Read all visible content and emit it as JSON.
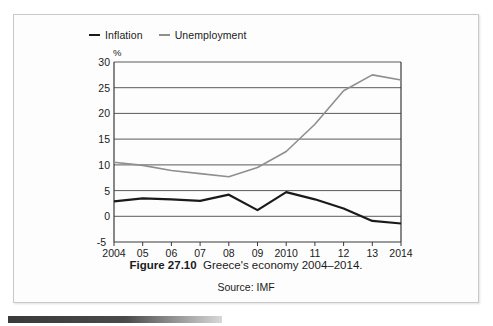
{
  "figure": {
    "caption_label": "Figure 27.10",
    "caption_text": "Greece's economy 2004–2014.",
    "source": "Source: IMF"
  },
  "colors": {
    "inflation": "#1a1a1a",
    "unemployment": "#8f8f8f",
    "grid": "#5a5a5a",
    "axis": "#4a4a4a",
    "frame": "#c9c9c9"
  },
  "chart_data": {
    "type": "line",
    "title": "Greece's economy 2004–2014.",
    "xlabel": "",
    "ylabel": "%",
    "ylim": [
      -5,
      30
    ],
    "yticks": [
      30,
      25,
      20,
      15,
      10,
      5,
      0,
      -5
    ],
    "grid": true,
    "legend_position": "top-left",
    "categories": [
      "2004",
      "05",
      "06",
      "07",
      "08",
      "09",
      "2010",
      "11",
      "12",
      "13",
      "2014"
    ],
    "x": [
      2004,
      2005,
      2006,
      2007,
      2008,
      2009,
      2010,
      2011,
      2012,
      2013,
      2014
    ],
    "series": [
      {
        "name": "Inflation",
        "color": "#1a1a1a",
        "values": [
          2.9,
          3.5,
          3.3,
          3.0,
          4.2,
          1.2,
          4.7,
          3.3,
          1.5,
          -0.9,
          -1.4
        ]
      },
      {
        "name": "Unemployment",
        "color": "#8f8f8f",
        "values": [
          10.5,
          9.9,
          8.9,
          8.3,
          7.7,
          9.5,
          12.6,
          17.9,
          24.4,
          27.5,
          26.5
        ]
      }
    ]
  },
  "legend": {
    "entries": [
      {
        "label": "Inflation",
        "color": "#1a1a1a"
      },
      {
        "label": "Unemployment",
        "color": "#8f8f8f"
      }
    ]
  }
}
